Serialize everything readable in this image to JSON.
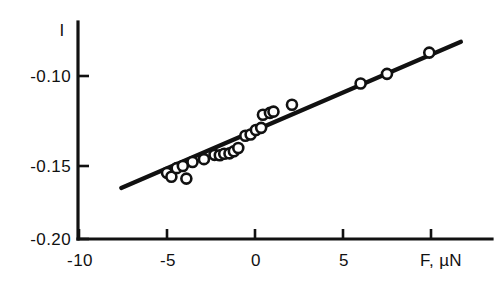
{
  "chart_data": {
    "type": "scatter",
    "title": "",
    "subtitle": "",
    "xlabel": "F, µN",
    "ylabel": "I",
    "xlim": [
      -10,
      11.5
    ],
    "ylim": [
      -0.205,
      -0.077
    ],
    "grid": false,
    "legend": null,
    "x_ticks": [
      -10,
      -5,
      0,
      5
    ],
    "x_tick_labels": [
      "-10",
      "-5",
      "0",
      "5"
    ],
    "y_ticks": [
      -0.2,
      -0.15,
      -0.1
    ],
    "y_tick_labels": [
      "-0.20",
      "-0.15",
      "-0.10"
    ],
    "marker_style": "open-circle",
    "points": [
      {
        "x": -5.0,
        "y": -0.1538
      },
      {
        "x": -4.75,
        "y": -0.156
      },
      {
        "x": -4.45,
        "y": -0.1512
      },
      {
        "x": -4.1,
        "y": -0.15
      },
      {
        "x": -3.9,
        "y": -0.157
      },
      {
        "x": -3.55,
        "y": -0.1478
      },
      {
        "x": -2.9,
        "y": -0.1462
      },
      {
        "x": -2.3,
        "y": -0.1438
      },
      {
        "x": -2.0,
        "y": -0.144
      },
      {
        "x": -1.75,
        "y": -0.1432
      },
      {
        "x": -1.45,
        "y": -0.143
      },
      {
        "x": -1.2,
        "y": -0.1418
      },
      {
        "x": -0.95,
        "y": -0.14
      },
      {
        "x": -0.55,
        "y": -0.1332
      },
      {
        "x": -0.25,
        "y": -0.1325
      },
      {
        "x": 0.05,
        "y": -0.13
      },
      {
        "x": 0.35,
        "y": -0.1288
      },
      {
        "x": 0.45,
        "y": -0.1215
      },
      {
        "x": 0.85,
        "y": -0.1205
      },
      {
        "x": 1.05,
        "y": -0.1198
      },
      {
        "x": 2.1,
        "y": -0.116
      },
      {
        "x": 6.0,
        "y": -0.1042
      },
      {
        "x": 7.5,
        "y": -0.0988
      },
      {
        "x": 9.9,
        "y": -0.087
      }
    ],
    "fit_line": {
      "type": "linear",
      "x_start": -7.6,
      "y_start": -0.1622,
      "x_end": 11.7,
      "y_end": -0.081
    }
  },
  "axes": {
    "y_axis_title": "I",
    "x_axis_title": "F, µN"
  }
}
